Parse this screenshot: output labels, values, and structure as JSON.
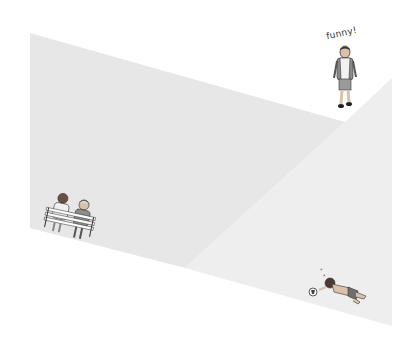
{
  "scene": {
    "description": "Minimal illustration of two gray planes with three small people vignettes",
    "background_color": "#ffffff",
    "plane_left_color": "#e7e7e7",
    "plane_right_color": "#eeeeee"
  },
  "walking_person": {
    "speech_text": "funny!",
    "shirt_color": "#f2f2f2",
    "backpack_color": "#8a8a8a",
    "shorts_color": "#9a9a9a"
  },
  "bench_couple": {
    "left_person_shirt": "#f0f0f0",
    "right_person_shirt": "#8c8c8c",
    "bench_color": "#ffffff"
  },
  "fallen_person": {
    "shorts_color": "#6f6f6f",
    "has_ball": true,
    "dizzy_marks": true
  }
}
